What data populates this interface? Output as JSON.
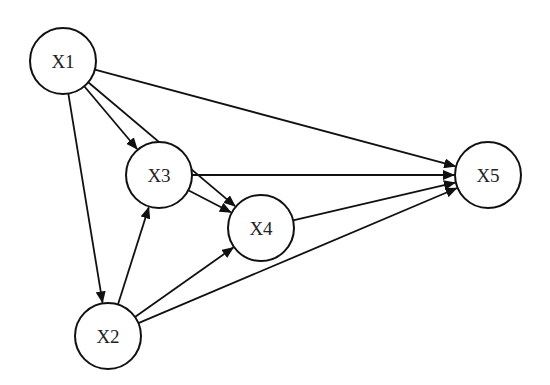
{
  "diagram": {
    "type": "directed-graph",
    "nodes": [
      {
        "id": "X1",
        "label": "X1"
      },
      {
        "id": "X2",
        "label": "X2"
      },
      {
        "id": "X3",
        "label": "X3"
      },
      {
        "id": "X4",
        "label": "X4"
      },
      {
        "id": "X5",
        "label": "X5"
      }
    ],
    "edges": [
      {
        "from": "X1",
        "to": "X5"
      },
      {
        "from": "X1",
        "to": "X3"
      },
      {
        "from": "X1",
        "to": "X4"
      },
      {
        "from": "X1",
        "to": "X2"
      },
      {
        "from": "X3",
        "to": "X5"
      },
      {
        "from": "X3",
        "to": "X4"
      },
      {
        "from": "X2",
        "to": "X3"
      },
      {
        "from": "X2",
        "to": "X4"
      },
      {
        "from": "X2",
        "to": "X5"
      },
      {
        "from": "X4",
        "to": "X5"
      }
    ]
  },
  "colors": {
    "stroke": "#111111",
    "text": "#222222",
    "background": "#ffffff"
  }
}
